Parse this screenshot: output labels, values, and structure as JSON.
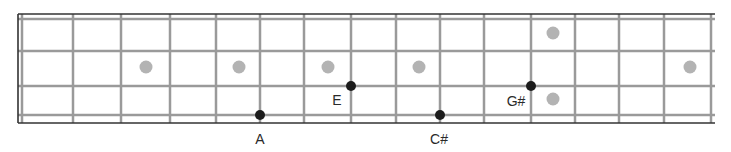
{
  "diagram": {
    "type": "bass-fretboard",
    "strings": 4,
    "frets": 15,
    "colors": {
      "border": "#333333",
      "line": "#9a9a9a",
      "inlay": "#b3b3b3",
      "note": "#1c1c1c",
      "label": "#2a2a2a"
    },
    "geometry": {
      "left": 18,
      "right": 715,
      "top": 14,
      "bottom": 123,
      "nut_x": 22,
      "string_y": [
        19,
        51,
        86,
        115
      ],
      "fret_x": [
        73,
        121,
        170,
        216,
        260,
        304,
        351,
        396,
        440,
        484,
        531,
        575,
        619,
        664,
        711
      ]
    },
    "inlays": [
      {
        "x": 146,
        "y": 67
      },
      {
        "x": 239,
        "y": 67
      },
      {
        "x": 328,
        "y": 67
      },
      {
        "x": 419,
        "y": 67
      },
      {
        "x": 553,
        "y": 33
      },
      {
        "x": 553,
        "y": 99
      },
      {
        "x": 690,
        "y": 67
      }
    ],
    "notes": [
      {
        "name": "A",
        "x": 260,
        "y": 115,
        "label_x": 260,
        "label_y": 139
      },
      {
        "name": "E",
        "x": 351,
        "y": 86,
        "label_x": 337,
        "label_y": 100
      },
      {
        "name": "C#",
        "x": 440,
        "y": 115,
        "label_x": 439,
        "label_y": 139
      },
      {
        "name": "G#",
        "x": 531,
        "y": 86,
        "label_x": 516,
        "label_y": 101
      }
    ]
  },
  "labels": {
    "note_a": "A",
    "note_e": "E",
    "note_csharp": "C#",
    "note_gsharp": "G#"
  }
}
